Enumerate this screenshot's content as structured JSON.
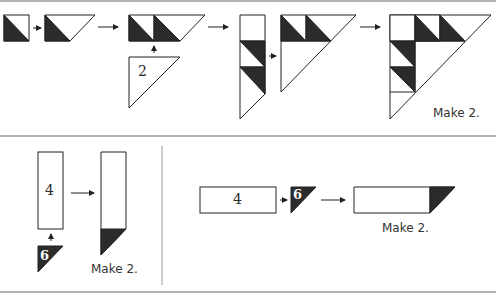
{
  "diagram": {
    "type": "quilt-block-assembly",
    "colors": {
      "dark": "#2b2b2b",
      "light": "#ffffff",
      "stroke": "#222222",
      "divider": "#9a9a9a"
    },
    "top_section": {
      "steps": [
        {
          "id": "hst-square",
          "description": "Half-square triangle unit"
        },
        {
          "id": "flying-unit",
          "description": "HST unit joined with triangle"
        },
        {
          "id": "double-unit",
          "description": "Two dark triangle units in a row"
        },
        {
          "id": "triangle-2",
          "label": "2"
        },
        {
          "id": "column-strip",
          "description": "Vertical strip with two dark triangles"
        },
        {
          "id": "partial-triangle",
          "description": "Large triangle with top row units"
        },
        {
          "id": "completed-triangle",
          "description": "Completed large triangle unit"
        }
      ],
      "make_label": "Make 2."
    },
    "bottom_left": {
      "rect_label": "4",
      "triangle_label": "6",
      "make_label": "Make 2."
    },
    "bottom_right": {
      "rect_label": "4",
      "triangle_label": "6",
      "make_label": "Make 2."
    }
  }
}
